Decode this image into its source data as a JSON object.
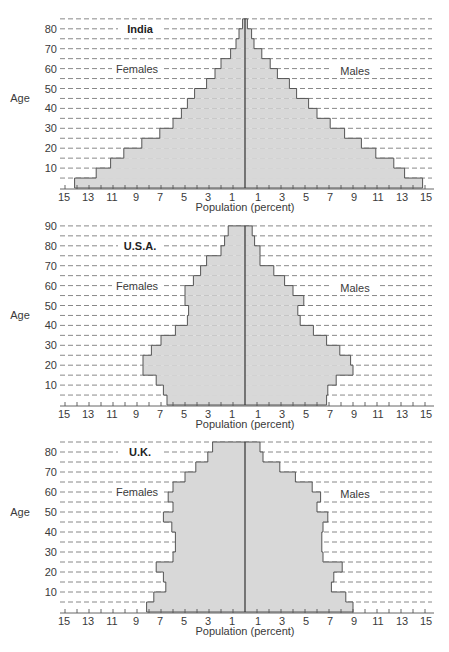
{
  "chart_data": [
    {
      "type": "bar",
      "subtype": "population-pyramid",
      "title": "India",
      "xlabel": "Population (percent)",
      "ylabel": "Age",
      "xlim": [
        -15,
        15
      ],
      "ylim": [
        0,
        85
      ],
      "xticks_labels": [
        "15",
        "13",
        "11",
        "9",
        "7",
        "5",
        "3",
        "1",
        "1",
        "3",
        "5",
        "7",
        "9",
        "11",
        "13",
        "15"
      ],
      "yticks": [
        10,
        20,
        30,
        40,
        50,
        60,
        70,
        80
      ],
      "grid": true,
      "left_label": "Females",
      "right_label": "Males",
      "age_groups": [
        "0-5",
        "5-10",
        "10-15",
        "15-20",
        "20-25",
        "25-30",
        "30-35",
        "35-40",
        "40-45",
        "45-50",
        "50-55",
        "55-60",
        "60-65",
        "65-70",
        "70-75",
        "75-80",
        "80-85"
      ],
      "series": [
        {
          "name": "Females",
          "values": [
            14.2,
            12.4,
            11.2,
            10.1,
            8.6,
            7.1,
            6.0,
            5.3,
            4.8,
            4.2,
            3.2,
            2.5,
            2.0,
            1.2,
            0.75,
            0.5,
            0.2
          ]
        },
        {
          "name": "Males",
          "values": [
            14.8,
            13.3,
            12.4,
            10.9,
            9.7,
            8.3,
            7.1,
            6.0,
            5.3,
            4.3,
            3.7,
            2.7,
            2.1,
            1.4,
            0.75,
            0.55,
            0.2
          ]
        }
      ]
    },
    {
      "type": "bar",
      "subtype": "population-pyramid",
      "title": "U.S.A.",
      "xlabel": "Population (percent)",
      "ylabel": "Age",
      "xlim": [
        -15,
        15
      ],
      "ylim": [
        0,
        90
      ],
      "xticks_labels": [
        "15",
        "13",
        "11",
        "9",
        "7",
        "5",
        "3",
        "1",
        "1",
        "3",
        "5",
        "7",
        "9",
        "11",
        "13",
        "15"
      ],
      "yticks": [
        10,
        20,
        30,
        40,
        50,
        60,
        70,
        80,
        90
      ],
      "grid": true,
      "left_label": "Females",
      "right_label": "Males",
      "age_groups": [
        "0-5",
        "5-10",
        "10-15",
        "15-20",
        "20-25",
        "25-30",
        "30-35",
        "35-40",
        "40-45",
        "45-50",
        "50-55",
        "55-60",
        "60-65",
        "65-70",
        "70-75",
        "75-80",
        "80-85",
        "85-90"
      ],
      "series": [
        {
          "name": "Females",
          "values": [
            6.5,
            6.8,
            7.4,
            8.5,
            8.5,
            7.8,
            7.0,
            5.8,
            4.8,
            4.7,
            5.0,
            5.0,
            4.3,
            3.7,
            3.2,
            2.0,
            1.7,
            1.4
          ]
        },
        {
          "name": "Males",
          "values": [
            6.8,
            6.9,
            7.6,
            9.0,
            8.8,
            7.9,
            6.8,
            5.7,
            4.6,
            4.4,
            4.9,
            4.0,
            3.3,
            2.4,
            1.25,
            1.25,
            0.8,
            0.6
          ]
        }
      ]
    },
    {
      "type": "bar",
      "subtype": "population-pyramid",
      "title": "U.K.",
      "xlabel": "Population (percent)",
      "ylabel": "Age",
      "xlim": [
        -15,
        15
      ],
      "ylim": [
        0,
        85
      ],
      "xticks_labels": [
        "15",
        "13",
        "11",
        "9",
        "7",
        "5",
        "3",
        "1",
        "1",
        "3",
        "5",
        "7",
        "9",
        "11",
        "13",
        "15"
      ],
      "yticks": [
        10,
        20,
        30,
        40,
        50,
        60,
        70,
        80
      ],
      "grid": true,
      "left_label": "Females",
      "right_label": "Males",
      "age_groups": [
        "0-5",
        "5-10",
        "10-15",
        "15-20",
        "20-25",
        "25-30",
        "30-35",
        "35-40",
        "40-45",
        "45-50",
        "50-55",
        "55-60",
        "60-65",
        "65-70",
        "70-75",
        "75-80",
        "80-85"
      ],
      "series": [
        {
          "name": "Females",
          "values": [
            8.2,
            7.6,
            6.6,
            6.8,
            7.4,
            6.0,
            5.8,
            5.8,
            6.1,
            6.8,
            6.0,
            6.4,
            6.0,
            5.0,
            4.1,
            3.1,
            2.7
          ]
        },
        {
          "name": "Males",
          "values": [
            9.0,
            8.4,
            7.2,
            7.4,
            8.1,
            6.5,
            6.4,
            6.4,
            6.5,
            6.9,
            6.0,
            6.3,
            5.6,
            4.2,
            2.9,
            1.5,
            1.25
          ]
        }
      ]
    }
  ]
}
